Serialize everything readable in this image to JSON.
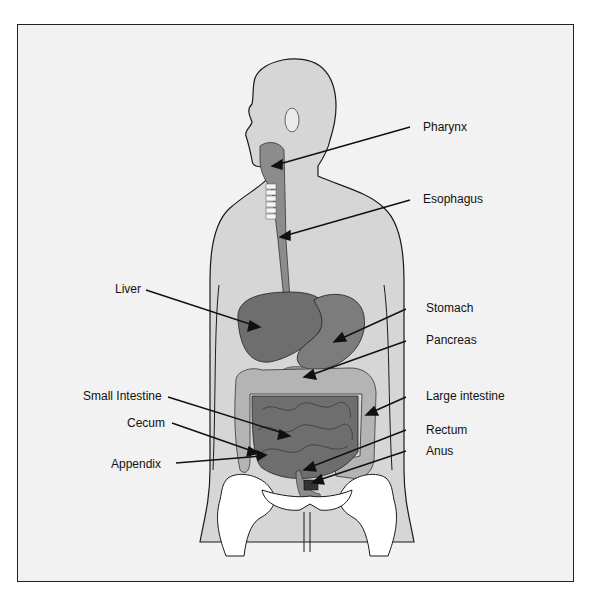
{
  "diagram": {
    "type": "anatomy",
    "colors": {
      "background": "#ffffff",
      "panel": "#f2f2f2",
      "body_silhouette": "#d6d6d6",
      "organ_dark": "#6e6e6e",
      "organ_mid": "#8c8c8c",
      "organ_light": "#b4b4b4",
      "bone": "#ffffff",
      "outline": "#1a1a1a"
    },
    "labels": [
      {
        "id": "pharynx",
        "text": "Pharynx"
      },
      {
        "id": "esophagus",
        "text": "Esophagus"
      },
      {
        "id": "liver",
        "text": "Liver"
      },
      {
        "id": "stomach",
        "text": "Stomach"
      },
      {
        "id": "pancreas",
        "text": "Pancreas"
      },
      {
        "id": "small_intestine",
        "text": "Small Intestine"
      },
      {
        "id": "large_intestine",
        "text": "Large intestine"
      },
      {
        "id": "cecum",
        "text": "Cecum"
      },
      {
        "id": "rectum",
        "text": "Rectum"
      },
      {
        "id": "appendix",
        "text": "Appendix"
      },
      {
        "id": "anus",
        "text": "Anus"
      }
    ]
  }
}
